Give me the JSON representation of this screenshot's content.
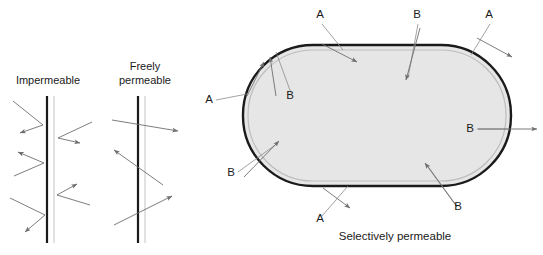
{
  "figure": {
    "background_color": "#ffffff",
    "text_color": "#1a1a1a"
  },
  "panels": {
    "impermeable": {
      "caption": "Impermeable",
      "caption_x": 48,
      "caption_y": 84,
      "membrane": {
        "x": 47,
        "y_top": 96,
        "y_bottom": 243,
        "dark_color": "#1a1a1a",
        "dark_width": 2.2,
        "light_color": "#c8c8c8",
        "light_width": 1.1,
        "light_offset": 7
      },
      "arrows": [
        {
          "name": "incoming-deflected-1",
          "x1": 13,
          "y1": 101,
          "x2": 43,
          "y2": 125,
          "color": "#6e6e6e"
        },
        {
          "name": "deflected-out-1",
          "x1": 43,
          "y1": 125,
          "x2": 20,
          "y2": 133,
          "color": "#6e6e6e",
          "head": true
        },
        {
          "name": "incoming-right-1",
          "x1": 92,
          "y1": 122,
          "x2": 58,
          "y2": 138,
          "color": "#6e6e6e"
        },
        {
          "name": "deflected-right-1",
          "x1": 58,
          "y1": 138,
          "x2": 80,
          "y2": 143,
          "color": "#6e6e6e",
          "head": true
        },
        {
          "name": "incoming-deflected-2",
          "x1": 14,
          "y1": 176,
          "x2": 44,
          "y2": 163,
          "color": "#6e6e6e"
        },
        {
          "name": "deflected-out-2",
          "x1": 44,
          "y1": 163,
          "x2": 18,
          "y2": 152,
          "color": "#6e6e6e",
          "head": true
        },
        {
          "name": "incoming-right-2",
          "x1": 90,
          "y1": 205,
          "x2": 57,
          "y2": 195,
          "color": "#6e6e6e"
        },
        {
          "name": "deflected-right-2",
          "x1": 57,
          "y1": 195,
          "x2": 77,
          "y2": 184,
          "color": "#6e6e6e",
          "head": true
        },
        {
          "name": "incoming-deflected-3",
          "x1": 10,
          "y1": 198,
          "x2": 45,
          "y2": 215,
          "color": "#6e6e6e"
        },
        {
          "name": "deflected-out-3",
          "x1": 45,
          "y1": 215,
          "x2": 25,
          "y2": 232,
          "color": "#6e6e6e",
          "head": true
        }
      ]
    },
    "freely_permeable": {
      "caption_line1": "Freely",
      "caption_line2": "permeable",
      "caption_x": 145,
      "caption_y1": 70,
      "caption_y2": 84,
      "membrane": {
        "x": 138,
        "y_top": 96,
        "y_bottom": 243,
        "dark_color": "#1a1a1a",
        "dark_width": 2.2,
        "light_color": "#c8c8c8",
        "light_width": 1.1,
        "light_offset": 7
      },
      "arrows": [
        {
          "name": "through-right-1",
          "x1": 112,
          "y1": 120,
          "x2": 178,
          "y2": 131,
          "color": "#6e6e6e",
          "head": true
        },
        {
          "name": "through-left-1",
          "x1": 163,
          "y1": 185,
          "x2": 114,
          "y2": 150,
          "color": "#6e6e6e",
          "head": true
        },
        {
          "name": "through-right-2",
          "x1": 114,
          "y1": 225,
          "x2": 172,
          "y2": 196,
          "color": "#6e6e6e",
          "head": true
        }
      ]
    },
    "selectively_permeable": {
      "caption": "Selectively permeable",
      "caption_x": 395,
      "caption_y": 240,
      "capsule": {
        "x": 243,
        "y": 45,
        "width": 268,
        "height": 141,
        "radius": 70,
        "fill": "#e6e6e6",
        "stroke": "#1a1a1a",
        "stroke_width": 2.4,
        "inner_stroke": "#bdbdbd",
        "inner_stroke_width": 1.2,
        "inner_inset": 5
      },
      "labels": [
        {
          "name": "label-a-top-left",
          "text": "A",
          "x": 320,
          "y": 18
        },
        {
          "name": "label-b-top-center",
          "text": "B",
          "x": 417,
          "y": 18
        },
        {
          "name": "label-a-top-right",
          "text": "A",
          "x": 489,
          "y": 18
        },
        {
          "name": "label-a-left",
          "text": "A",
          "x": 209,
          "y": 103
        },
        {
          "name": "label-b-upper-left-inner",
          "text": "B",
          "x": 290,
          "y": 99
        },
        {
          "name": "label-b-lower-left",
          "text": "B",
          "x": 231,
          "y": 176
        },
        {
          "name": "label-b-right",
          "text": "B",
          "x": 470,
          "y": 132
        },
        {
          "name": "label-a-bottom",
          "text": "A",
          "x": 320,
          "y": 222
        },
        {
          "name": "label-b-bottom-right",
          "text": "B",
          "x": 458,
          "y": 210
        }
      ],
      "leaders": [
        {
          "name": "leader-a-top-left",
          "x1": 322,
          "y1": 24,
          "x2": 343,
          "y2": 50,
          "color": "#8c8c8c"
        },
        {
          "name": "leader-b-top-center",
          "x1": 418,
          "y1": 24,
          "x2": 408,
          "y2": 78,
          "color": "#8c8c8c"
        },
        {
          "name": "leader-a-top-right",
          "x1": 490,
          "y1": 24,
          "x2": 471,
          "y2": 55,
          "color": "#8c8c8c"
        },
        {
          "name": "leader-a-left",
          "x1": 216,
          "y1": 100,
          "x2": 247,
          "y2": 94,
          "color": "#8c8c8c"
        },
        {
          "name": "leader-b-upper-left-inner",
          "x1": 291,
          "y1": 93,
          "x2": 276,
          "y2": 52,
          "color": "#8c8c8c"
        },
        {
          "name": "leader-b-lower-left",
          "x1": 238,
          "y1": 172,
          "x2": 278,
          "y2": 143,
          "color": "#8c8c8c"
        },
        {
          "name": "leader-b-right",
          "x1": 477,
          "y1": 129,
          "x2": 508,
          "y2": 129,
          "color": "#8c8c8c"
        },
        {
          "name": "leader-a-bottom",
          "x1": 322,
          "y1": 216,
          "x2": 348,
          "y2": 186,
          "color": "#8c8c8c"
        },
        {
          "name": "leader-b-bottom-right",
          "x1": 456,
          "y1": 205,
          "x2": 427,
          "y2": 165,
          "color": "#8c8c8c"
        }
      ],
      "arrows": [
        {
          "name": "arrow-a-top-left-out",
          "x1": 322,
          "y1": 44,
          "x2": 357,
          "y2": 62,
          "color": "#6e6e6e"
        },
        {
          "name": "arrow-b-top-center-in",
          "x1": 420,
          "y1": 28,
          "x2": 406,
          "y2": 80,
          "color": "#6e6e6e"
        },
        {
          "name": "arrow-a-top-right-out",
          "x1": 477,
          "y1": 38,
          "x2": 512,
          "y2": 57,
          "color": "#6e6e6e"
        },
        {
          "name": "arrow-a-left-out",
          "x1": 247,
          "y1": 96,
          "x2": 264,
          "y2": 62,
          "color": "#6e6e6e"
        },
        {
          "name": "arrow-b-upper-left-in",
          "x1": 276,
          "y1": 96,
          "x2": 270,
          "y2": 57,
          "color": "#6e6e6e"
        },
        {
          "name": "arrow-b-lower-left-in",
          "x1": 244,
          "y1": 177,
          "x2": 279,
          "y2": 141,
          "color": "#6e6e6e"
        },
        {
          "name": "arrow-b-right-out",
          "x1": 478,
          "y1": 129,
          "x2": 537,
          "y2": 129,
          "color": "#6e6e6e"
        },
        {
          "name": "arrow-a-bottom-out",
          "x1": 323,
          "y1": 188,
          "x2": 350,
          "y2": 208,
          "color": "#6e6e6e"
        },
        {
          "name": "arrow-b-bottom-right-in",
          "x1": 457,
          "y1": 207,
          "x2": 425,
          "y2": 163,
          "color": "#6e6e6e"
        }
      ]
    }
  }
}
